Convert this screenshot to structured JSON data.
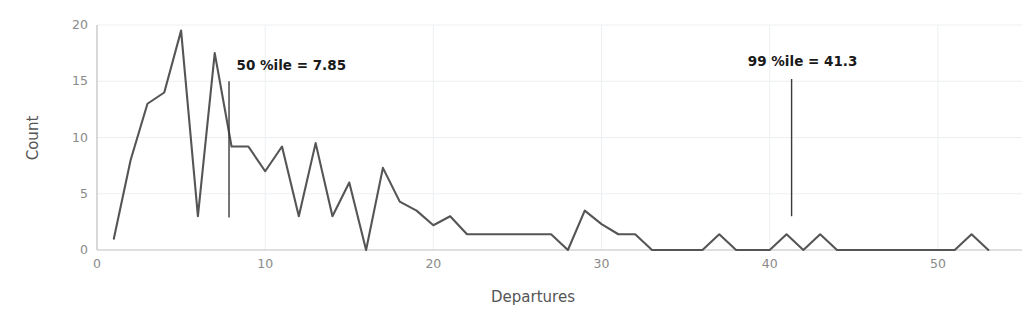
{
  "chart_data": {
    "type": "line",
    "title": "",
    "xlabel": "Departures",
    "ylabel": "Count",
    "xlim": [
      0,
      55
    ],
    "ylim": [
      0,
      20
    ],
    "grid": true,
    "legend": "none",
    "line_color": "#555555",
    "grid_color": "#eceff1",
    "axis_color": "#bfbfbf",
    "xticks": [
      0,
      10,
      20,
      30,
      40,
      50
    ],
    "xtick_labels": [
      "0",
      "10",
      "20",
      "30",
      "40",
      "50"
    ],
    "yticks": [
      0,
      5,
      10,
      15,
      20
    ],
    "ytick_labels": [
      "0",
      "5",
      "10",
      "15",
      "20"
    ],
    "x": [
      1,
      2,
      3,
      4,
      5,
      6,
      7,
      8,
      9,
      10,
      11,
      12,
      13,
      14,
      15,
      16,
      17,
      18,
      19,
      20,
      21,
      22,
      23,
      24,
      25,
      26,
      27,
      28,
      29,
      30,
      31,
      32,
      33,
      34,
      35,
      36,
      37,
      38,
      39,
      40,
      41,
      42,
      43,
      44,
      45,
      46,
      47,
      48,
      49,
      50,
      51,
      52,
      53
    ],
    "values": [
      1,
      8,
      13,
      14,
      19.5,
      3,
      17.5,
      9.2,
      9.2,
      7,
      9.2,
      3,
      9.5,
      3,
      6,
      0,
      7.3,
      4.3,
      3.5,
      2.2,
      3,
      1.4,
      1.4,
      1.4,
      1.4,
      1.4,
      1.4,
      0,
      3.5,
      2.3,
      1.4,
      1.4,
      0,
      0,
      0,
      0,
      1.4,
      0,
      0,
      0,
      1.4,
      0,
      1.4,
      0,
      0,
      0,
      0,
      0,
      0,
      0,
      0,
      1.4,
      0
    ],
    "annotations": [
      {
        "name": "p50",
        "label": "50 %ile = 7.85",
        "x": 7.85,
        "y_top": 15,
        "y_bottom": 2.9,
        "label_x": 8.3,
        "label_y": 16.0
      },
      {
        "name": "p99",
        "label": "99 %ile = 41.3",
        "x": 41.3,
        "y_top": 15.2,
        "y_bottom": 3.0,
        "label_x": 38.7,
        "label_y": 16.4
      }
    ]
  }
}
